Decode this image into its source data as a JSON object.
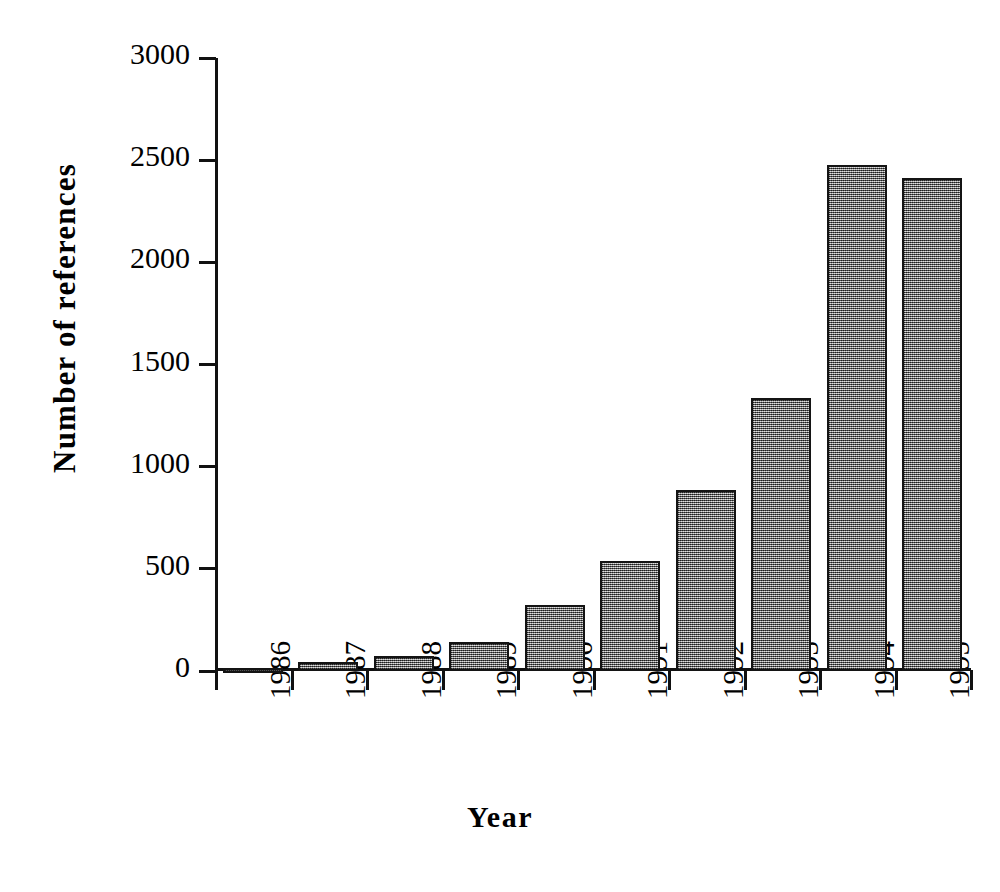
{
  "chart_data": {
    "type": "bar",
    "title": "",
    "xlabel": "Year",
    "ylabel": "Number of references",
    "categories": [
      "1986",
      "1987",
      "1988",
      "1989",
      "1990",
      "1991",
      "1992",
      "1993",
      "1994",
      "1995"
    ],
    "values": [
      13,
      44,
      73,
      143,
      323,
      539,
      887,
      1338,
      2475,
      2412
    ],
    "ylim": [
      0,
      3000
    ],
    "ytick_labels": [
      "0",
      "500",
      "1000",
      "1500",
      "2000",
      "2500",
      "3000"
    ],
    "ytick_values": [
      0,
      500,
      1000,
      1500,
      2000,
      2500,
      3000
    ],
    "grid": false,
    "legend": null,
    "bar_fill_color": "#7d7d7d",
    "bar_edge_color": "#141414",
    "axis_color": "#111111",
    "background_color": "#ffffff"
  },
  "axes": {
    "y_title": "Number of references",
    "x_title": "Year"
  },
  "caption": {
    "text": ""
  }
}
